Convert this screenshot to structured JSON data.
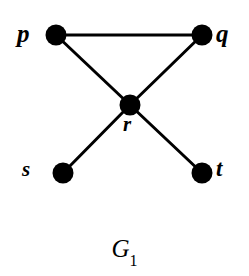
{
  "figure": {
    "caption_base": "G",
    "caption_subscript": "1",
    "caption_full": "G1",
    "background_color": "#ffffff",
    "ink_color": "#000000"
  },
  "graph": {
    "node_radius": 10,
    "edge_width": 3,
    "nodes": [
      {
        "id": "p",
        "label": "p",
        "cx": 56,
        "cy": 35,
        "label_position": "left"
      },
      {
        "id": "q",
        "label": "q",
        "cx": 202,
        "cy": 35,
        "label_position": "right"
      },
      {
        "id": "r",
        "label": "r",
        "cx": 130,
        "cy": 105,
        "label_position": "below"
      },
      {
        "id": "s",
        "label": "s",
        "cx": 63,
        "cy": 173,
        "label_position": "left"
      },
      {
        "id": "t",
        "label": "t",
        "cx": 202,
        "cy": 173,
        "label_position": "right"
      }
    ],
    "edges": [
      {
        "from": "p",
        "to": "q"
      },
      {
        "from": "p",
        "to": "r"
      },
      {
        "from": "q",
        "to": "r"
      },
      {
        "from": "r",
        "to": "s"
      },
      {
        "from": "r",
        "to": "t"
      }
    ]
  }
}
